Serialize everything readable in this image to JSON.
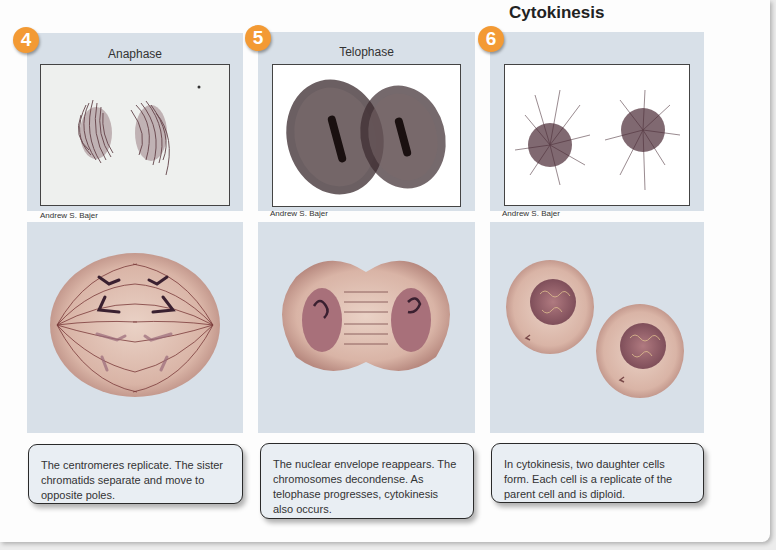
{
  "stages": [
    {
      "number": "4",
      "title": "Anaphase",
      "heading": "",
      "photo_credit": "Andrew S. Bajer",
      "description": "The centromeres replicate. The sister chromatids separate and move to opposite poles."
    },
    {
      "number": "5",
      "title": "Telophase",
      "heading": "",
      "photo_credit": "Andrew S. Bajer",
      "description": "The nuclear envelope reappears. The chromosomes decondense. As telophase progresses, cytokinesis also occurs."
    },
    {
      "number": "6",
      "title": "",
      "heading": "Cytokinesis",
      "photo_credit": "Andrew S. Bajer",
      "description": "In cytokinesis, two daughter cells form. Each cell is a replicate of the parent cell and is diploid."
    }
  ],
  "colors": {
    "badge": "#f39a34",
    "panel": "#d8e0e8",
    "cell": "#d9b4a6",
    "nucleus": "#9c5a66"
  }
}
